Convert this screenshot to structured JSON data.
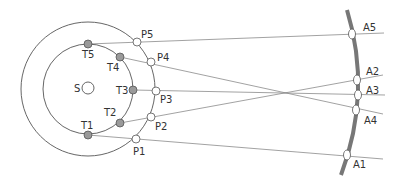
{
  "diagram": {
    "title": "",
    "colors": {
      "line": "#8a8a8a",
      "orbit": "#555555",
      "earth_dot": "#9a9a9a",
      "open_dot": "#ffffff",
      "arc": "#777777",
      "text": "#333333"
    },
    "sun": {
      "label": "S",
      "x": 88,
      "y": 88
    },
    "inner_orbit": {
      "cx": 88,
      "cy": 89,
      "r": 45
    },
    "outer_orbit": {
      "cx": 88,
      "cy": 89,
      "r": 67
    },
    "inner_points": [
      {
        "label": "T1",
        "x": 88,
        "y": 135
      },
      {
        "label": "T2",
        "x": 120,
        "y": 123
      },
      {
        "label": "T3",
        "x": 133,
        "y": 90
      },
      {
        "label": "T4",
        "x": 120,
        "y": 57
      },
      {
        "label": "T5",
        "x": 88,
        "y": 44
      }
    ],
    "outer_points": [
      {
        "label": "P1",
        "x": 136,
        "y": 139
      },
      {
        "label": "P2",
        "x": 151,
        "y": 117
      },
      {
        "label": "P3",
        "x": 156,
        "y": 91
      },
      {
        "label": "P4",
        "x": 151,
        "y": 62
      },
      {
        "label": "P5",
        "x": 137,
        "y": 42
      }
    ],
    "apparent_points": [
      {
        "label": "A1",
        "x": 347,
        "y": 155
      },
      {
        "label": "A2",
        "x": 357,
        "y": 80
      },
      {
        "label": "A3",
        "x": 358,
        "y": 95
      },
      {
        "label": "A4",
        "x": 356,
        "y": 110
      },
      {
        "label": "A5",
        "x": 352,
        "y": 34
      }
    ]
  }
}
